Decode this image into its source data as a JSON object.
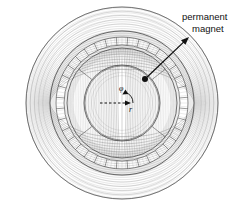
{
  "figure": {
    "name": "permanent-magnet-machine-flux-plot",
    "background_color": "#ffffff",
    "line_color": "#555555",
    "strong_line_color": "#333333",
    "text_color": "#111111",
    "width": 243,
    "height": 206
  },
  "annotations": {
    "magnet_label": {
      "line1": "permanent",
      "line2": "magnet",
      "x": 182,
      "y": 20
    },
    "angle_symbol": "φ",
    "radius_symbol": "r"
  },
  "geometry": {
    "center_x": 122,
    "center_y": 103,
    "outer_radius": 96,
    "stator_outer_radius": 72,
    "stator_slot_outer_radius": 66,
    "stator_slot_inner_radius": 58,
    "magnet_outer_radius": 55,
    "magnet_inner_radius": 38,
    "rotor_radius": 37,
    "slot_count": 36,
    "magnet_arc_count": 4
  },
  "chart_data": {
    "type": "contour",
    "title": "",
    "coordinate_system": "polar",
    "axis_symbols": [
      "r",
      "φ"
    ],
    "flux_line_count": 60,
    "regions": [
      {
        "name": "air-outer",
        "inner_r": 72,
        "outer_r": 96
      },
      {
        "name": "stator-yoke",
        "inner_r": 66,
        "outer_r": 72
      },
      {
        "name": "stator-slots",
        "inner_r": 58,
        "outer_r": 66
      },
      {
        "name": "air-gap",
        "inner_r": 55,
        "outer_r": 58
      },
      {
        "name": "permanent-magnet",
        "inner_r": 38,
        "outer_r": 55
      },
      {
        "name": "rotor-core",
        "inner_r": 0,
        "outer_r": 37
      }
    ]
  },
  "pointer": {
    "tail_x": 145,
    "tail_y": 79,
    "head_x": 189,
    "head_y": 37
  }
}
